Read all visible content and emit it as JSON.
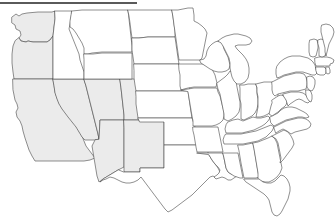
{
  "figure": {
    "kind": "choropleth-map",
    "region": "contiguous-united-states",
    "title": "",
    "subtitle": "",
    "background_color": "#ffffff",
    "top_rule": {
      "visible": true,
      "color": "#5a5a5a",
      "x": 0,
      "y": 2,
      "width": 137,
      "height": 2
    }
  },
  "legend": {
    "visible": false,
    "entries": [
      {
        "label": "",
        "color": "#ebebeb",
        "name": "highlighted"
      },
      {
        "label": "",
        "color": "#ffffff",
        "name": "not-highlighted"
      }
    ]
  },
  "style": {
    "shaded_fill": "#ebebeb",
    "unshaded_fill": "#ffffff",
    "border_color": "#4a4a4a",
    "border_width": 0.62
  },
  "chart_data": {
    "type": "map",
    "title": "",
    "xlabel": "",
    "ylabel": "",
    "value_type": "binary-highlight",
    "shaded_count": 8,
    "unshaded_count": 41,
    "categories": [
      "WA",
      "OR",
      "CA",
      "NV",
      "UT",
      "CO",
      "AZ",
      "NM",
      "ID",
      "MT",
      "WY",
      "ND",
      "SD",
      "NE",
      "KS",
      "OK",
      "TX",
      "MN",
      "IA",
      "MO",
      "AR",
      "LA",
      "WI",
      "IL",
      "MS",
      "MI",
      "IN",
      "OH",
      "KY",
      "TN",
      "AL",
      "GA",
      "FL",
      "SC",
      "NC",
      "VA",
      "WV",
      "MD",
      "DE",
      "PA",
      "NJ",
      "NY",
      "CT",
      "RI",
      "MA",
      "VT",
      "NH",
      "ME",
      "DC"
    ],
    "values": [
      1,
      1,
      1,
      1,
      1,
      1,
      1,
      1,
      0,
      0,
      0,
      0,
      0,
      0,
      0,
      0,
      0,
      0,
      0,
      0,
      0,
      0,
      0,
      0,
      0,
      0,
      0,
      0,
      0,
      0,
      0,
      0,
      0,
      0,
      0,
      0,
      0,
      0,
      0,
      0,
      0,
      0,
      0,
      0,
      0,
      0,
      0,
      0,
      0
    ],
    "highlighted_states": [
      "Washington",
      "Oregon",
      "California",
      "Nevada",
      "Utah",
      "Colorado",
      "Arizona",
      "New Mexico"
    ]
  },
  "states": [
    {
      "id": "WA",
      "name": "Washington",
      "shaded": true
    },
    {
      "id": "OR",
      "name": "Oregon",
      "shaded": true
    },
    {
      "id": "CA",
      "name": "California",
      "shaded": true
    },
    {
      "id": "NV",
      "name": "Nevada",
      "shaded": true
    },
    {
      "id": "UT",
      "name": "Utah",
      "shaded": true
    },
    {
      "id": "CO",
      "name": "Colorado",
      "shaded": true
    },
    {
      "id": "AZ",
      "name": "Arizona",
      "shaded": true
    },
    {
      "id": "NM",
      "name": "New Mexico",
      "shaded": true
    },
    {
      "id": "ID",
      "name": "Idaho",
      "shaded": false
    },
    {
      "id": "MT",
      "name": "Montana",
      "shaded": false
    },
    {
      "id": "WY",
      "name": "Wyoming",
      "shaded": false
    },
    {
      "id": "ND",
      "name": "North Dakota",
      "shaded": false
    },
    {
      "id": "SD",
      "name": "South Dakota",
      "shaded": false
    },
    {
      "id": "NE",
      "name": "Nebraska",
      "shaded": false
    },
    {
      "id": "KS",
      "name": "Kansas",
      "shaded": false
    },
    {
      "id": "OK",
      "name": "Oklahoma",
      "shaded": false
    },
    {
      "id": "TX",
      "name": "Texas",
      "shaded": false
    },
    {
      "id": "MN",
      "name": "Minnesota",
      "shaded": false
    },
    {
      "id": "IA",
      "name": "Iowa",
      "shaded": false
    },
    {
      "id": "MO",
      "name": "Missouri",
      "shaded": false
    },
    {
      "id": "AR",
      "name": "Arkansas",
      "shaded": false
    },
    {
      "id": "LA",
      "name": "Louisiana",
      "shaded": false
    },
    {
      "id": "WI",
      "name": "Wisconsin",
      "shaded": false
    },
    {
      "id": "IL",
      "name": "Illinois",
      "shaded": false
    },
    {
      "id": "MS",
      "name": "Mississippi",
      "shaded": false
    },
    {
      "id": "MI",
      "name": "Michigan",
      "shaded": false
    },
    {
      "id": "IN",
      "name": "Indiana",
      "shaded": false
    },
    {
      "id": "OH",
      "name": "Ohio",
      "shaded": false
    },
    {
      "id": "KY",
      "name": "Kentucky",
      "shaded": false
    },
    {
      "id": "TN",
      "name": "Tennessee",
      "shaded": false
    },
    {
      "id": "AL",
      "name": "Alabama",
      "shaded": false
    },
    {
      "id": "GA",
      "name": "Georgia",
      "shaded": false
    },
    {
      "id": "FL",
      "name": "Florida",
      "shaded": false
    },
    {
      "id": "SC",
      "name": "South Carolina",
      "shaded": false
    },
    {
      "id": "NC",
      "name": "North Carolina",
      "shaded": false
    },
    {
      "id": "VA",
      "name": "Virginia",
      "shaded": false
    },
    {
      "id": "WV",
      "name": "West Virginia",
      "shaded": false
    },
    {
      "id": "MD",
      "name": "Maryland",
      "shaded": false
    },
    {
      "id": "DE",
      "name": "Delaware",
      "shaded": false
    },
    {
      "id": "PA",
      "name": "Pennsylvania",
      "shaded": false
    },
    {
      "id": "NJ",
      "name": "New Jersey",
      "shaded": false
    },
    {
      "id": "NY",
      "name": "New York",
      "shaded": false
    },
    {
      "id": "CT",
      "name": "Connecticut",
      "shaded": false
    },
    {
      "id": "RI",
      "name": "Rhode Island",
      "shaded": false
    },
    {
      "id": "MA",
      "name": "Massachusetts",
      "shaded": false
    },
    {
      "id": "VT",
      "name": "Vermont",
      "shaded": false
    },
    {
      "id": "NH",
      "name": "New Hampshire",
      "shaded": false
    },
    {
      "id": "ME",
      "name": "Maine",
      "shaded": false
    }
  ]
}
